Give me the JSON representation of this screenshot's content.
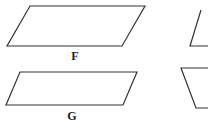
{
  "figure": {
    "shapes": [
      {
        "id": "F",
        "label": "F",
        "type": "parallelogram",
        "points": "30,6 145,6 122,46 7,46"
      },
      {
        "id": "G",
        "label": "G",
        "type": "parallelogram",
        "points": "20,72 137,72 123,105 6,105"
      },
      {
        "id": "partial-upper-right",
        "label": "",
        "type": "partial-shape",
        "points": "208,8 200,8 190,46 208,46"
      },
      {
        "id": "partial-lower-right",
        "label": "",
        "type": "trapezoid",
        "points": "208,68 181,68 196,108 208,108"
      }
    ],
    "stroke_color": "#333333"
  },
  "labels": {
    "F": "F",
    "G": "G"
  }
}
